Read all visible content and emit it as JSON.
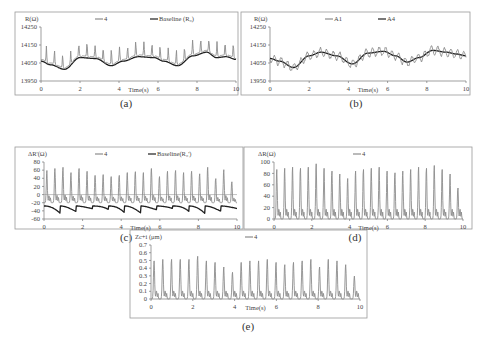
{
  "chart_data": [
    {
      "id": "a",
      "type": "line",
      "caption": "(a)",
      "ylabel": "R(Ω)",
      "xlabel": "Time(s)",
      "xlim": [
        0,
        10
      ],
      "ylim": [
        13950,
        14250
      ],
      "xticks": [
        "0",
        "2",
        "4",
        "6",
        "8",
        "10"
      ],
      "yticks": [
        "13950",
        "14050",
        "14150",
        "14250"
      ],
      "ytick_values": [
        13950,
        14050,
        14150,
        14250
      ],
      "zero_line": false,
      "legend": [
        {
          "label": "4",
          "color": "#8c8c8c"
        },
        {
          "label": "Baseline (R₀)",
          "color": "#1e1e1e"
        }
      ],
      "series": [
        {
          "name": "4",
          "color": "#8c8c8c",
          "kind": "pulse",
          "base_offset": 10,
          "peak_amp": 80,
          "peaks": 24,
          "baseline_ref": "Baseline"
        },
        {
          "name": "Baseline",
          "color": "#1e1e1e",
          "kind": "smooth",
          "x": [
            0,
            0.5,
            1.2,
            2.0,
            2.8,
            3.6,
            4.2,
            5.0,
            5.8,
            6.3,
            7.0,
            7.8,
            8.5,
            9.0,
            9.5,
            10
          ],
          "y": [
            14060,
            14040,
            14015,
            14080,
            14075,
            14035,
            14060,
            14085,
            14080,
            14060,
            14035,
            14090,
            14110,
            14080,
            14085,
            14070
          ]
        }
      ]
    },
    {
      "id": "b",
      "type": "line",
      "caption": "(b)",
      "ylabel": "R(Ω)",
      "xlabel": "Time(s)",
      "xlim": [
        0,
        10
      ],
      "ylim": [
        13950,
        14250
      ],
      "xticks": [
        "0",
        "2",
        "4",
        "6",
        "8",
        "10"
      ],
      "yticks": [
        "13950",
        "14050",
        "14150",
        "14250"
      ],
      "ytick_values": [
        13950,
        14050,
        14150,
        14250
      ],
      "zero_line": false,
      "legend": [
        {
          "label": "A1",
          "color": "#8c8c8c"
        },
        {
          "label": "A4",
          "color": "#1e1e1e"
        }
      ],
      "series": [
        {
          "name": "A1",
          "color": "#8c8c8c",
          "kind": "oscillate",
          "amp": 25,
          "peaks": 30,
          "baseline_ref": "A4"
        },
        {
          "name": "A4",
          "color": "#1e1e1e",
          "kind": "smooth",
          "x": [
            0,
            0.5,
            1.2,
            2.0,
            2.6,
            3.4,
            4.2,
            5.0,
            5.8,
            6.4,
            7.0,
            7.6,
            8.3,
            9.0,
            9.5,
            10
          ],
          "y": [
            14075,
            14060,
            14025,
            14090,
            14110,
            14090,
            14045,
            14105,
            14115,
            14090,
            14055,
            14080,
            14120,
            14110,
            14100,
            14090
          ]
        }
      ]
    },
    {
      "id": "c",
      "type": "line",
      "caption": "(c)",
      "ylabel": "ΔR'(Ω)",
      "xlabel": "Time(s)",
      "xlim": [
        0,
        10
      ],
      "ylim": [
        -60,
        80
      ],
      "xticks": [
        "0",
        "2",
        "4",
        "6",
        "8",
        "10"
      ],
      "yticks": [
        "-60",
        "-40",
        "-20",
        "0",
        "20",
        "40",
        "60",
        "80"
      ],
      "ytick_values": [
        -60,
        -40,
        -20,
        0,
        20,
        40,
        60,
        80
      ],
      "zero_line": true,
      "legend": [
        {
          "label": "4",
          "color": "#8c8c8c"
        },
        {
          "label": "Baseline(R₀')",
          "color": "#1e1e1e"
        }
      ],
      "series": [
        {
          "name": "4",
          "color": "#8c8c8c",
          "kind": "pulse_abs",
          "low": -20,
          "peaks_values": [
            60,
            65,
            68,
            55,
            65,
            58,
            48,
            50,
            45,
            48,
            55,
            57,
            55,
            65,
            45,
            58,
            60,
            55,
            58,
            52,
            68,
            40,
            62,
            32
          ]
        },
        {
          "name": "Baseline",
          "color": "#1e1e1e",
          "kind": "scallop",
          "low": -28,
          "dip": -40
        }
      ]
    },
    {
      "id": "d",
      "type": "line",
      "caption": "(d)",
      "ylabel": "ΔR(Ω)",
      "xlabel": "Time(s)",
      "xlim": [
        0,
        10
      ],
      "ylim": [
        0,
        100
      ],
      "xticks": [
        "0",
        "2",
        "4",
        "6",
        "8",
        "10"
      ],
      "yticks": [
        "0",
        "20",
        "40",
        "60",
        "80",
        "100"
      ],
      "ytick_values": [
        0,
        20,
        40,
        60,
        80,
        100
      ],
      "zero_line": false,
      "legend": [
        {
          "label": "4",
          "color": "#8c8c8c"
        }
      ],
      "series": [
        {
          "name": "4",
          "color": "#8c8c8c",
          "kind": "pulse_abs",
          "low": 0,
          "mid": 20,
          "peaks_values": [
            88,
            90,
            92,
            90,
            92,
            98,
            90,
            85,
            80,
            72,
            85,
            88,
            90,
            92,
            85,
            82,
            85,
            88,
            92,
            90,
            95,
            88,
            80,
            55
          ]
        }
      ]
    },
    {
      "id": "e",
      "type": "line",
      "caption": "(e)",
      "ylabel": "Zc+i (μm)",
      "xlabel": "Time(s)",
      "xlim": [
        0,
        10
      ],
      "ylim": [
        0,
        0.7
      ],
      "xticks": [
        "0",
        "2",
        "4",
        "6",
        "8",
        "10"
      ],
      "yticks": [
        "0",
        "0.1",
        "0.2",
        "0.3",
        "0.4",
        "0.5",
        "0.6",
        "0.7"
      ],
      "ytick_values": [
        0,
        0.1,
        0.2,
        0.3,
        0.4,
        0.5,
        0.6,
        0.7
      ],
      "zero_line": false,
      "legend": [
        {
          "label": "4",
          "color": "#8c8c8c"
        }
      ],
      "series": [
        {
          "name": "4",
          "color": "#8c8c8c",
          "kind": "pulse_abs",
          "low": 0,
          "mid": 0.12,
          "peaks_values": [
            0.5,
            0.52,
            0.52,
            0.52,
            0.52,
            0.56,
            0.5,
            0.48,
            0.42,
            0.35,
            0.48,
            0.5,
            0.5,
            0.52,
            0.48,
            0.45,
            0.48,
            0.5,
            0.52,
            0.42,
            0.52,
            0.5,
            0.45,
            0.3
          ]
        }
      ]
    }
  ]
}
